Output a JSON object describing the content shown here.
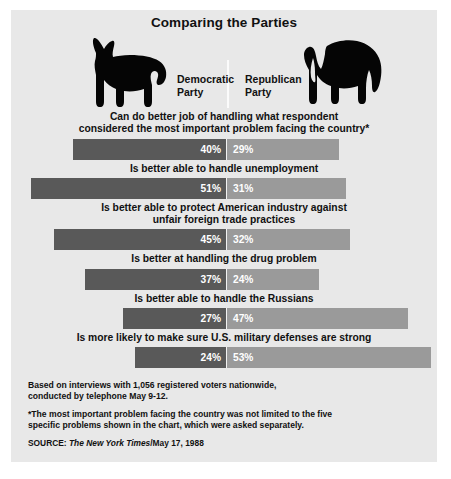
{
  "title": "Comparing the Parties",
  "parties": {
    "democratic": "Democratic\nParty",
    "republican": "Republican\nParty",
    "democratic_icon": "donkey-silhouette",
    "republican_icon": "elephant-silhouette"
  },
  "chart_data": {
    "type": "bar",
    "title": "Comparing the Parties",
    "subtype": "diverging-paired-horizontal",
    "xlabel": "",
    "ylabel": "",
    "series": [
      {
        "name": "Democratic Party",
        "color": "#595959",
        "values": [
          40,
          51,
          45,
          37,
          27,
          24
        ]
      },
      {
        "name": "Republican Party",
        "color": "#9a9a9a",
        "values": [
          29,
          31,
          32,
          24,
          47,
          53
        ]
      }
    ],
    "categories": [
      "Can do better job of handling what respondent considered the most important problem facing the country*",
      "Is better able to handle unemployment",
      "Is better able to protect American industry against unfair foreign trade practices",
      "Is better at handling the drug problem",
      "Is better able to handle the Russians",
      "Is more likely to make sure U.S. military defenses are strong"
    ],
    "units": "percent",
    "grid": false,
    "legend_position": "top"
  },
  "rows": [
    {
      "question": "Can do better job of handling what respondent\nconsidered the most important problem facing the country*",
      "dem": 40,
      "rep": 29,
      "dem_label": "40%",
      "rep_label": "29%"
    },
    {
      "question": "Is better able to handle unemployment",
      "dem": 51,
      "rep": 31,
      "dem_label": "51%",
      "rep_label": "31%"
    },
    {
      "question": "Is better able to protect American industry against\nunfair foreign trade practices",
      "dem": 45,
      "rep": 32,
      "dem_label": "45%",
      "rep_label": "32%"
    },
    {
      "question": "Is better at handling the drug problem",
      "dem": 37,
      "rep": 24,
      "dem_label": "37%",
      "rep_label": "24%"
    },
    {
      "question": "Is better able to handle the Russians",
      "dem": 27,
      "rep": 47,
      "dem_label": "27%",
      "rep_label": "47%"
    },
    {
      "question": "Is more likely to make sure U.S. military defenses are strong",
      "dem": 24,
      "rep": 53,
      "dem_label": "24%",
      "rep_label": "53%"
    }
  ],
  "footer": {
    "methodology": "Based on interviews with 1,056 registered voters nationwide,\nconducted by telephone May 9-12.",
    "asterisk_note": "*The most important problem facing the country was not limited to the five\nspecific problems shown in the chart, which were asked separately.",
    "source_label": "SOURCE: ",
    "source_publication": "The New York Times",
    "source_date": "/May 17, 1988"
  },
  "layout": {
    "center_x": 216,
    "px_per_point": 3.85
  },
  "colors": {
    "panel_bg": "#e8e8e8",
    "democratic_bar": "#595959",
    "republican_bar": "#9a9a9a",
    "text": "#111111",
    "bar_text": "#ffffff"
  }
}
